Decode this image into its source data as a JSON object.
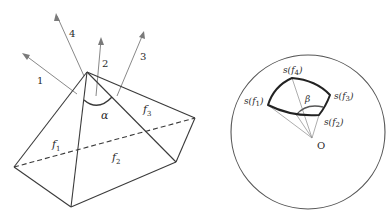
{
  "figure": {
    "left_panel": {
      "description": "pyramid with face normals",
      "normal_labels": [
        "1",
        "2",
        "3",
        "4"
      ],
      "face_labels": [
        {
          "base": "f",
          "sub": "1"
        },
        {
          "base": "f",
          "sub": "2"
        },
        {
          "base": "f",
          "sub": "3"
        }
      ],
      "angle_label": "α"
    },
    "right_panel": {
      "description": "Gauss sphere with spherical polygon",
      "vertex_labels": [
        {
          "pre": "s(",
          "base": "f",
          "sub": "1",
          "post": ")"
        },
        {
          "pre": "s(",
          "base": "f",
          "sub": "2",
          "post": ")"
        },
        {
          "pre": "s(",
          "base": "f",
          "sub": "3",
          "post": ")"
        },
        {
          "pre": "s(",
          "base": "f",
          "sub": "4",
          "post": ")"
        }
      ],
      "angle_label": "β",
      "center_label": "O"
    }
  },
  "colors": {
    "line": "#3a3a3a",
    "arrow": "#7a7a7a",
    "background": "#ffffff"
  }
}
